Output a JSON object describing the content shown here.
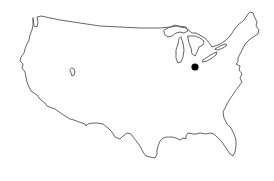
{
  "map": {
    "region": "Contiguous United States",
    "style": "outline",
    "outline_color": "#555555",
    "background_color": "#ffffff",
    "marker": {
      "shape": "filled-circle",
      "color": "#000000",
      "location_description": "Northern Ohio, south of Lake Erie"
    },
    "features": [
      "us-outline",
      "great-lakes",
      "great-salt-lake"
    ]
  }
}
